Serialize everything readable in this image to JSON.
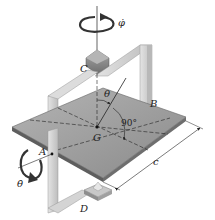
{
  "figure": {
    "type": "mechanics-diagram",
    "labels": {
      "phi_dot": "φ̇",
      "point_c": "C",
      "theta": "θ",
      "point_b": "B",
      "point_g": "G",
      "right_angle": "90°",
      "point_a": "A",
      "theta_dot": "θ̇",
      "dimension_c": "c",
      "point_d": "D"
    },
    "colors": {
      "plate_top": "#9a9a9a",
      "plate_edge": "#5e5e5e",
      "frame": "#d2d2d2",
      "frame_shadow": "#a8a8a8",
      "bearing": "#8c8c8c",
      "line": "#222222"
    }
  }
}
